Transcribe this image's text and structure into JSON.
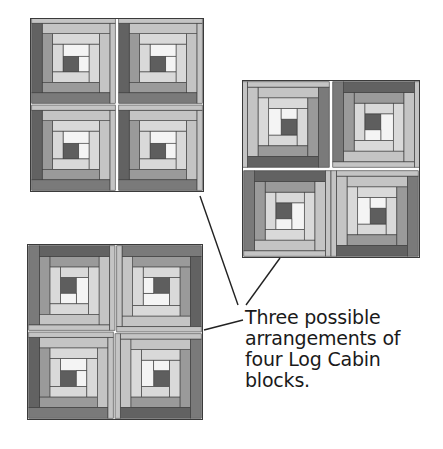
{
  "figure": {
    "caption_lines": [
      "Three possible",
      "arrangements of",
      "four Log Cabin",
      "blocks."
    ],
    "colors": {
      "center": "#5e5e5e",
      "white": "#f4f4f4",
      "light1": "#d9d9d9",
      "light2": "#c4c4c4",
      "dark1": "#9a9a9a",
      "dark2": "#7a7a7a",
      "dark3": "#626262",
      "seam": "#3a3a3a"
    },
    "quilts": [
      {
        "name": "arrangement-1",
        "x": 30,
        "y": 18,
        "size": 174,
        "rotations": [
          0,
          0,
          0,
          0
        ]
      },
      {
        "name": "arrangement-2",
        "x": 242,
        "y": 80,
        "size": 178,
        "rotations": [
          270,
          90,
          90,
          270
        ]
      },
      {
        "name": "arrangement-3",
        "x": 27,
        "y": 244,
        "size": 176,
        "rotations": [
          90,
          180,
          0,
          270
        ]
      }
    ],
    "leaders": [
      {
        "x1": 200,
        "y1": 196,
        "x2": 238,
        "y2": 305
      },
      {
        "x1": 280,
        "y1": 258,
        "x2": 246,
        "y2": 305
      },
      {
        "x1": 204,
        "y1": 330,
        "x2": 243,
        "y2": 320
      }
    ]
  }
}
